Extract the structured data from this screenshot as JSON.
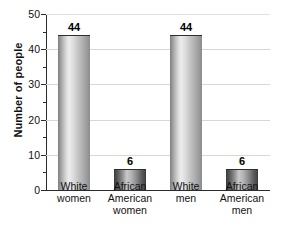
{
  "chart_data": {
    "type": "bar",
    "title": "",
    "xlabel": "",
    "ylabel": "Number of people",
    "ylim": [
      0,
      50
    ],
    "ytick_step": 10,
    "yminor_step": 5,
    "grid": true,
    "legend": "none",
    "categories": [
      "White women",
      "African American women",
      "White men",
      "African American men"
    ],
    "category_lines": [
      [
        "White",
        "women"
      ],
      [
        "African",
        "American",
        "women"
      ],
      [
        "White",
        "men"
      ],
      [
        "African",
        "American",
        "men"
      ]
    ],
    "values": [
      44,
      6,
      44,
      6
    ],
    "value_labels": [
      "44",
      "6",
      "44",
      "6"
    ],
    "ytick_labels": [
      "0",
      "10",
      "20",
      "30",
      "40",
      "50"
    ],
    "bar_styles": [
      "light",
      "dark",
      "light",
      "dark"
    ],
    "colors": {
      "bar_light_edge": "#7e7e7e",
      "bar_light_highlight": "#ededed",
      "bar_dark_edge": "#3a3a3a",
      "bar_dark_highlight": "#c9c9c9",
      "axis": "#2b2b2b",
      "gridline": "#d8d8d8",
      "background": "#ffffff",
      "text": "#111111"
    }
  }
}
